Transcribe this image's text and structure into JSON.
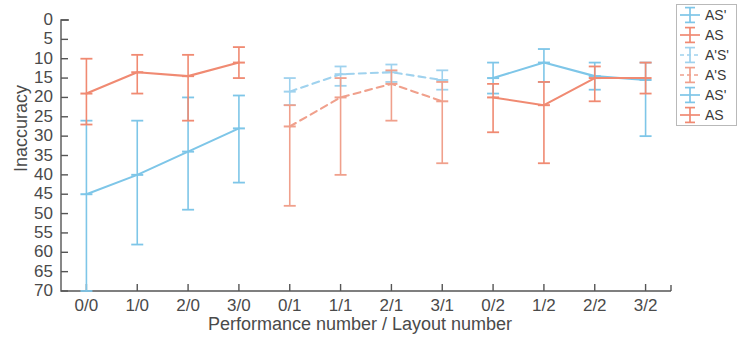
{
  "chart_data": {
    "type": "line",
    "title": "",
    "xlabel": "Performance number / Layout number",
    "ylabel": "Inaccuracy",
    "categories": [
      "0/0",
      "1/0",
      "2/0",
      "3/0",
      "0/1",
      "1/1",
      "2/1",
      "3/1",
      "0/2",
      "1/2",
      "2/2",
      "3/2"
    ],
    "ylim": [
      0,
      70
    ],
    "y_inverted": true,
    "yticks": [
      0,
      5,
      10,
      15,
      20,
      25,
      30,
      35,
      40,
      45,
      50,
      55,
      60,
      65,
      70
    ],
    "grid": false,
    "legend_position": "right-outside",
    "series": [
      {
        "name": "AS'",
        "color": "#7ec6e8",
        "linestyle": "solid",
        "group": 0,
        "x": [
          "0/0",
          "1/0",
          "2/0",
          "3/0"
        ],
        "values": [
          45.0,
          40.0,
          34.0,
          28.0
        ],
        "err_low": [
          26.0,
          26.0,
          20.0,
          19.5
        ],
        "err_high": [
          70.0,
          58.0,
          49.0,
          42.0
        ]
      },
      {
        "name": "AS",
        "color": "#f08a72",
        "linestyle": "solid",
        "group": 0,
        "x": [
          "0/0",
          "1/0",
          "2/0",
          "3/0"
        ],
        "values": [
          19.0,
          13.5,
          14.5,
          11.0
        ],
        "err_low": [
          10.0,
          9.0,
          9.0,
          7.0
        ],
        "err_high": [
          27.0,
          19.0,
          26.0,
          15.0
        ]
      },
      {
        "name": "A'S'",
        "color": "#9fd2ee",
        "linestyle": "dashed",
        "group": 1,
        "x": [
          "0/1",
          "1/1",
          "2/1",
          "3/1"
        ],
        "values": [
          18.5,
          14.0,
          13.5,
          15.5
        ],
        "err_low": [
          15.0,
          12.0,
          11.5,
          13.0
        ],
        "err_high": [
          22.0,
          17.0,
          16.0,
          18.0
        ]
      },
      {
        "name": "A'S",
        "color": "#f0a08c",
        "linestyle": "dashed",
        "group": 1,
        "x": [
          "0/1",
          "1/1",
          "2/1",
          "3/1"
        ],
        "values": [
          27.5,
          20.0,
          16.5,
          21.0
        ],
        "err_low": [
          22.0,
          15.0,
          13.0,
          16.0
        ],
        "err_high": [
          48.0,
          40.0,
          26.0,
          37.0
        ]
      },
      {
        "name": "AS'",
        "color": "#7ec6e8",
        "linestyle": "solid",
        "group": 2,
        "x": [
          "0/2",
          "1/2",
          "2/2",
          "3/2"
        ],
        "values": [
          15.0,
          11.0,
          14.5,
          15.5
        ],
        "err_low": [
          11.0,
          7.5,
          11.0,
          11.0
        ],
        "err_high": [
          19.0,
          16.0,
          18.0,
          30.0
        ]
      },
      {
        "name": "AS",
        "color": "#f08a72",
        "linestyle": "solid",
        "group": 2,
        "x": [
          "0/2",
          "1/2",
          "2/2",
          "3/2"
        ],
        "values": [
          20.0,
          22.0,
          15.0,
          15.0
        ],
        "err_low": [
          16.5,
          16.0,
          12.0,
          11.0
        ],
        "err_high": [
          29.0,
          37.0,
          21.0,
          19.0
        ]
      }
    ]
  },
  "axes": {
    "ylabel": "Inaccuracy",
    "xlabel": "Performance number / Layout number",
    "yticks": [
      "0",
      "5",
      "10",
      "15",
      "20",
      "25",
      "30",
      "35",
      "40",
      "45",
      "50",
      "55",
      "60",
      "65",
      "70"
    ],
    "xticks": [
      "0/0",
      "1/0",
      "2/0",
      "3/0",
      "0/1",
      "1/1",
      "2/1",
      "3/1",
      "0/2",
      "1/2",
      "2/2",
      "3/2"
    ]
  },
  "legend": {
    "entries": [
      {
        "label": "AS'",
        "color": "#7ec6e8",
        "style": "solid"
      },
      {
        "label": "AS",
        "color": "#f08a72",
        "style": "solid"
      },
      {
        "label": "A'S'",
        "color": "#9fd2ee",
        "style": "dashed"
      },
      {
        "label": "A'S",
        "color": "#f0a08c",
        "style": "dashed"
      },
      {
        "label": "AS'",
        "color": "#7ec6e8",
        "style": "solid"
      },
      {
        "label": "AS",
        "color": "#f08a72",
        "style": "solid"
      }
    ]
  },
  "colors": {
    "blue": "#7ec6e8",
    "blue_light": "#9fd2ee",
    "orange": "#f08a72",
    "orange_light": "#f0a08c",
    "axis": "#555555",
    "text": "#4a4a4a"
  }
}
